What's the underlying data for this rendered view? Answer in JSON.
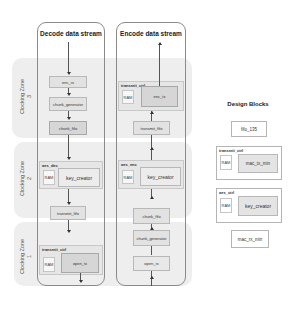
{
  "zones": [
    {
      "id": "zone3",
      "label": "Clocking Zone 3"
    },
    {
      "id": "zone2",
      "label": "Clocking Zone 2"
    },
    {
      "id": "zone1",
      "label": "Clocking Zone 1"
    }
  ],
  "decode": {
    "title": "Decode data stream",
    "blocks": {
      "enc_rx": "enc_rx",
      "chunk_generator": "chunk_generator",
      "chunk_fifo": "chunk_fifo",
      "aes_dec_group": "aes_dec",
      "aes_dec_ram": "RAM",
      "key_creator": "key_creator",
      "transmit_fifo": "transmit_fifo",
      "transmit_ctrl_group": "transmit_ctrl",
      "transmit_ctrl_ram": "RAM",
      "open_tx": "open_tx"
    }
  },
  "encode": {
    "title": "Encode data stream",
    "blocks": {
      "transmit_ctrl_group": "transmit_ctrl",
      "transmit_ctrl_ram": "RAM",
      "enc_tx": "enc_tx",
      "transmit_fifo": "transmit_fifo",
      "aes_enc_group": "aes_enc",
      "aes_enc_ram": "RAM",
      "key_creator": "key_creator",
      "chunk_fifo": "chunk_fifo",
      "chunk_generator": "chunk_generator",
      "open_rx": "open_rx"
    }
  },
  "legend": {
    "title": "Design Blocks",
    "fifo": "fifo_135",
    "transmit_ctrl_group": "transmit_ctrl",
    "transmit_ctrl_ram": "RAM",
    "mac_tx_min": "mac_tx_min",
    "aes_ctrl_group": "aes_ctrl",
    "aes_ctrl_ram": "RAM",
    "key_creator": "key_creator",
    "mac_rx_min": "mac_rx_min"
  }
}
